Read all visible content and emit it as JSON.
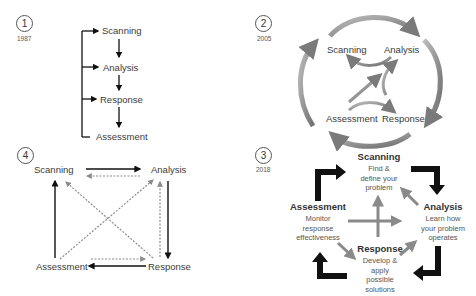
{
  "panels": [
    {
      "number": "1",
      "year": "1987",
      "style": "linear flow with feedback bracket",
      "steps": [
        "Scanning",
        "Analysis",
        "Response",
        "Assessment"
      ]
    },
    {
      "number": "2",
      "year": "2005",
      "style": "circular cycle with inner loops",
      "steps": [
        "Scanning",
        "Analysis",
        "Response",
        "Assessment"
      ]
    },
    {
      "number": "3",
      "year": "2018",
      "style": "cycle with descriptions",
      "steps": [
        {
          "title": "Scanning",
          "desc_lines": [
            "Find &",
            "define your",
            "problem"
          ]
        },
        {
          "title": "Analysis",
          "desc_lines": [
            "Learn how",
            "your problem",
            "operates"
          ]
        },
        {
          "title": "Response",
          "desc_lines": [
            "Develop &",
            "apply",
            "possible",
            "solutions"
          ]
        },
        {
          "title": "Assessment",
          "desc_lines": [
            "Monitor",
            "response",
            "effectiveness"
          ]
        }
      ]
    },
    {
      "number": "4",
      "year": "",
      "style": "square with solid and dotted bidirectional arrows",
      "steps": [
        "Scanning",
        "Analysis",
        "Response",
        "Assessment"
      ]
    }
  ],
  "colors": {
    "text": "#3a3a3a",
    "arrow_black": "#111111",
    "arrow_grey": "#8a8a8a",
    "arrow_dotted": "#8c8c8c"
  }
}
